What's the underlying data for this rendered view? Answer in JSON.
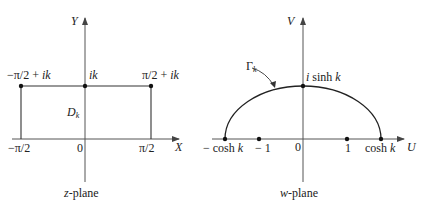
{
  "z_plane": {
    "caption_var": "z",
    "caption_rest": "-plane",
    "axis_x": "X",
    "axis_y": "Y",
    "origin": "0",
    "tick_left": "−π/2",
    "tick_right": "π/2",
    "corner_left": "−π/2 + ",
    "corner_left_it": "ik",
    "center_top": "ik",
    "corner_right": "π/2 + ",
    "corner_right_it": "ik",
    "region": "D",
    "region_sub": "k"
  },
  "w_plane": {
    "caption_var": "w",
    "caption_rest": "-plane",
    "axis_u": "U",
    "axis_v": "V",
    "origin": "0",
    "left_end": "− cosh ",
    "left_end_it": "k",
    "minus_one": "− 1",
    "one": "1",
    "right_end": "cosh ",
    "right_end_it": "k",
    "top_i": "i",
    "top_rest": " sinh ",
    "top_k": "k",
    "curve": "Γ",
    "curve_sub": "k"
  },
  "colors": {
    "line": "#333333",
    "axis": "#555555",
    "text": "#222222"
  }
}
